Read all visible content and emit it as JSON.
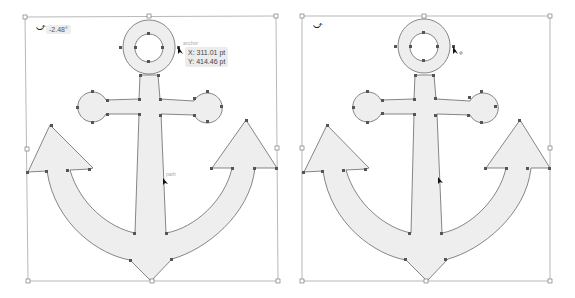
{
  "colors": {
    "shape_fill": "#eeeeee",
    "shape_stroke": "#555555",
    "anchor_point": "#555555",
    "bbox_stroke": "#888888",
    "tooltip_bg": "#ececec"
  },
  "left_panel": {
    "rotation_angle": "-2.48°",
    "smart_guide_label": "anchor",
    "path_hint_label": "path",
    "coordinates": {
      "x": "X: 311.01 pt",
      "y": "Y: 414.46 pt"
    }
  },
  "right_panel": {
    "cursor_hint": "o"
  },
  "icons": {
    "rotate": "rotate-icon",
    "cursor": "arrow-cursor-icon"
  }
}
